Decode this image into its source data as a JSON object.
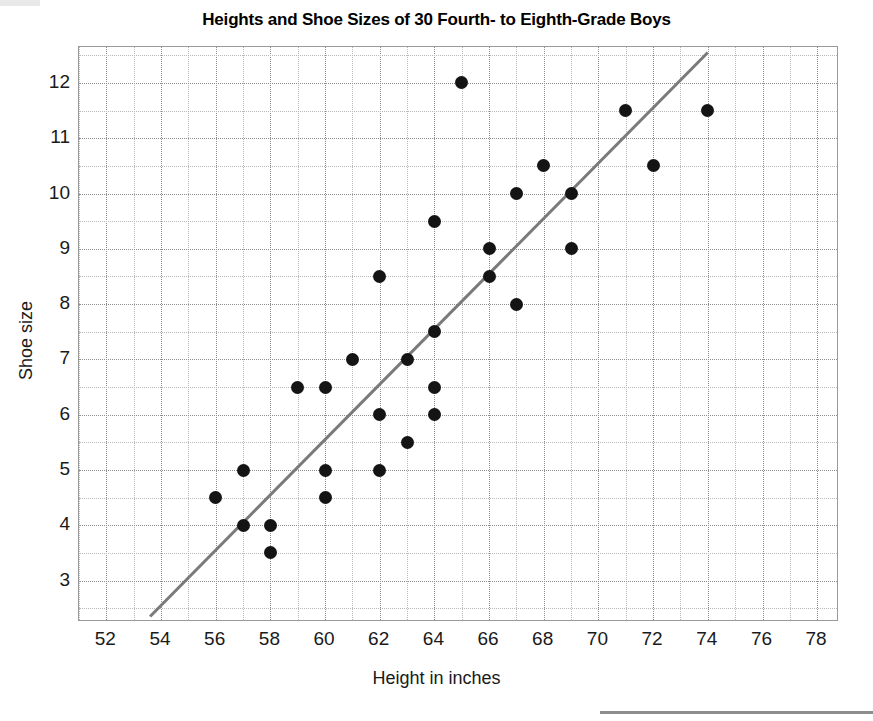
{
  "chart_data": {
    "type": "scatter",
    "title": "Heights and Shoe Sizes of 30 Fourth- to Eighth-Grade Boys",
    "xlabel": "Height in inches",
    "ylabel": "Shoe size",
    "xlim": [
      51.0,
      78.8
    ],
    "ylim": [
      2.25,
      12.65
    ],
    "xticks": [
      52,
      54,
      56,
      58,
      60,
      62,
      64,
      66,
      68,
      70,
      72,
      74,
      76,
      78
    ],
    "yticks": [
      3,
      4,
      5,
      6,
      7,
      8,
      9,
      10,
      11,
      12
    ],
    "x_minor_step": 1,
    "y_minor_step": 0.5,
    "grid": "dotted both axes, major and minor",
    "legend": "none",
    "marker": {
      "shape": "circle",
      "color": "#141414",
      "size": 13
    },
    "points": [
      {
        "x": 56,
        "y": 4.5
      },
      {
        "x": 57,
        "y": 5
      },
      {
        "x": 57,
        "y": 4
      },
      {
        "x": 58,
        "y": 4
      },
      {
        "x": 58,
        "y": 3.5
      },
      {
        "x": 59,
        "y": 6.5
      },
      {
        "x": 60,
        "y": 6.5
      },
      {
        "x": 60,
        "y": 5
      },
      {
        "x": 60,
        "y": 4.5
      },
      {
        "x": 61,
        "y": 7
      },
      {
        "x": 62,
        "y": 8.5
      },
      {
        "x": 62,
        "y": 6
      },
      {
        "x": 62,
        "y": 5
      },
      {
        "x": 63,
        "y": 7
      },
      {
        "x": 63,
        "y": 5.5
      },
      {
        "x": 64,
        "y": 9.5
      },
      {
        "x": 64,
        "y": 7.5
      },
      {
        "x": 64,
        "y": 6.5
      },
      {
        "x": 64,
        "y": 6
      },
      {
        "x": 65,
        "y": 12
      },
      {
        "x": 66,
        "y": 9
      },
      {
        "x": 66,
        "y": 8.5
      },
      {
        "x": 67,
        "y": 10
      },
      {
        "x": 67,
        "y": 8
      },
      {
        "x": 68,
        "y": 10.5
      },
      {
        "x": 69,
        "y": 10
      },
      {
        "x": 69,
        "y": 9
      },
      {
        "x": 71,
        "y": 11.5
      },
      {
        "x": 72,
        "y": 10.5
      },
      {
        "x": 74,
        "y": 11.5
      }
    ],
    "trendline": {
      "type": "line",
      "color": "#7a7a7a",
      "width": 3,
      "x_start": 53.6,
      "y_start": 2.35,
      "x_end": 74.0,
      "y_end": 12.55
    }
  },
  "footer": {
    "rule_color": "#8d8d8d"
  }
}
